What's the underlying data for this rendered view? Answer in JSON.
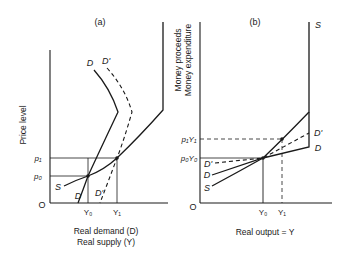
{
  "panel_a": {
    "title": "(a)",
    "y_axis_label": "Price level",
    "x_axis_label_line1": "Real demand (D)",
    "x_axis_label_line2": "Real supply (Y)",
    "origin": "O",
    "y_ticks": {
      "p1": "p₁",
      "p0": "p₀"
    },
    "x_ticks": {
      "y0": "Y₀",
      "y1": "Y₁"
    },
    "curves": {
      "supply": "S",
      "demand": "D",
      "demand_shifted": "D'"
    }
  },
  "panel_b": {
    "title": "(b)",
    "y_axis_label_line1": "Money proceeds",
    "y_axis_label_line2": "Money expenditure",
    "x_axis_label": "Real output = Y",
    "origin": "O",
    "y_ticks": {
      "p1y1": "p₁Y₁",
      "p0y0": "p₀Y₀"
    },
    "x_ticks": {
      "y0": "Y₀",
      "y1": "Y₁"
    },
    "curves": {
      "supply": "S",
      "demand": "D",
      "demand_shifted": "D'"
    }
  },
  "colors": {
    "ink": "#1a1a1a",
    "background": "#ffffff"
  }
}
